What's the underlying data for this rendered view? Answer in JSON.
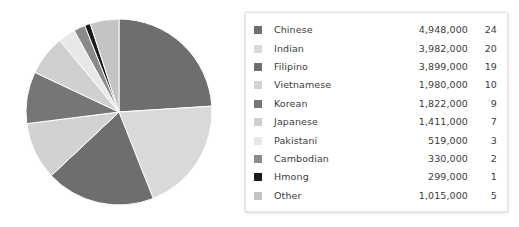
{
  "chart_data": {
    "type": "pie",
    "title": "",
    "xlabel": "",
    "ylabel": "",
    "legend_position": "right",
    "grid": false,
    "start_angle_deg": 0,
    "direction": "clockwise",
    "categories": [
      "Chinese",
      "Indian",
      "Filipino",
      "Vietnamese",
      "Korean",
      "Japanese",
      "Pakistani",
      "Cambodian",
      "Hmong",
      "Other"
    ],
    "values": [
      4948000,
      3982000,
      3899000,
      1980000,
      1822000,
      1411000,
      519000,
      330000,
      299000,
      1015000
    ],
    "percentages": [
      24,
      20,
      19,
      10,
      9,
      7,
      3,
      2,
      1,
      5
    ],
    "colors": [
      "#6e6e6e",
      "#d9d9d9",
      "#6e6e6e",
      "#d2d2d2",
      "#767676",
      "#d0d0d0",
      "#e8e8e8",
      "#8a8a8a",
      "#1a1a1a",
      "#c4c4c4"
    ],
    "slices": [
      {
        "label": "Chinese",
        "value_text": "4,948,000",
        "value": 4948000,
        "percent_text": "24",
        "percent": 24,
        "color": "#6e6e6e"
      },
      {
        "label": "Indian",
        "value_text": "3,982,000",
        "value": 3982000,
        "percent_text": "20",
        "percent": 20,
        "color": "#d9d9d9"
      },
      {
        "label": "Filipino",
        "value_text": "3,899,000",
        "value": 3899000,
        "percent_text": "19",
        "percent": 19,
        "color": "#6e6e6e"
      },
      {
        "label": "Vietnamese",
        "value_text": "1,980,000",
        "value": 1980000,
        "percent_text": "10",
        "percent": 10,
        "color": "#d2d2d2"
      },
      {
        "label": "Korean",
        "value_text": "1,822,000",
        "value": 1822000,
        "percent_text": "9",
        "percent": 9,
        "color": "#767676"
      },
      {
        "label": "Japanese",
        "value_text": "1,411,000",
        "value": 1411000,
        "percent_text": "7",
        "percent": 7,
        "color": "#d0d0d0"
      },
      {
        "label": "Pakistani",
        "value_text": "519,000",
        "value": 519000,
        "percent_text": "3",
        "percent": 3,
        "color": "#e8e8e8"
      },
      {
        "label": "Cambodian",
        "value_text": "330,000",
        "value": 330000,
        "percent_text": "2",
        "percent": 2,
        "color": "#8a8a8a"
      },
      {
        "label": "Hmong",
        "value_text": "299,000",
        "value": 299000,
        "percent_text": "1",
        "percent": 1,
        "color": "#1a1a1a"
      },
      {
        "label": "Other",
        "value_text": "1,015,000",
        "value": 1015000,
        "percent_text": "5",
        "percent": 5,
        "color": "#c4c4c4"
      }
    ]
  },
  "legend": {
    "rows": [
      {
        "label": "Chinese",
        "value": "4,948,000",
        "percent": "24",
        "color": "#6e6e6e"
      },
      {
        "label": "Indian",
        "value": "3,982,000",
        "percent": "20",
        "color": "#d9d9d9"
      },
      {
        "label": "Filipino",
        "value": "3,899,000",
        "percent": "19",
        "color": "#6e6e6e"
      },
      {
        "label": "Vietnamese",
        "value": "1,980,000",
        "percent": "10",
        "color": "#d2d2d2"
      },
      {
        "label": "Korean",
        "value": "1,822,000",
        "percent": "9",
        "color": "#767676"
      },
      {
        "label": "Japanese",
        "value": "1,411,000",
        "percent": "7",
        "color": "#d0d0d0"
      },
      {
        "label": "Pakistani",
        "value": "519,000",
        "percent": "3",
        "color": "#e8e8e8"
      },
      {
        "label": "Cambodian",
        "value": "330,000",
        "percent": "2",
        "color": "#8a8a8a"
      },
      {
        "label": "Hmong",
        "value": "299,000",
        "percent": "1",
        "color": "#1a1a1a"
      },
      {
        "label": "Other",
        "value": "1,015,000",
        "percent": "5",
        "color": "#c4c4c4"
      }
    ]
  },
  "pie": {
    "center_x": 94,
    "center_y": 94,
    "radius": 93,
    "stroke": "#ffffff",
    "stroke_width": 1
  }
}
